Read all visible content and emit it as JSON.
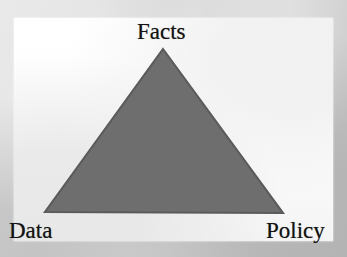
{
  "figure": {
    "type": "triangle-diagram",
    "caption_text": "",
    "vertices": [
      {
        "id": "facts",
        "label": "Facts",
        "position": "top"
      },
      {
        "id": "data",
        "label": "Data",
        "position": "bottom-left"
      },
      {
        "id": "policy",
        "label": "Policy",
        "position": "bottom-right"
      }
    ],
    "shape": {
      "name": "filled-triangle",
      "fill_color": "#6e6e6e",
      "stroke_color": "#5a5a5a",
      "apex": [
        149,
        31
      ],
      "bottom_left": [
        31,
        194
      ],
      "bottom_right": [
        269,
        195
      ]
    },
    "panel": {
      "background_color": "#ffffff",
      "left": 14,
      "top": 18,
      "width": 319,
      "height": 223
    },
    "page_background_color": "#c9c9c9",
    "text_color": "#131313"
  },
  "scan_artifacts": {
    "margin_smudges": [
      "",
      "",
      "",
      ""
    ],
    "panel_bleed_through": [
      "",
      "",
      "",
      "",
      ""
    ]
  }
}
